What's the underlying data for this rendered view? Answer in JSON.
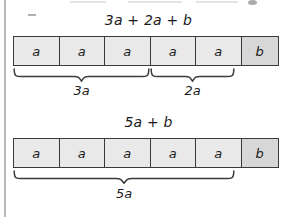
{
  "colors": {
    "cell_fill": "#e9e9e9",
    "cell_b_fill": "#d7d7d7",
    "stroke": "#3a3a3a",
    "text": "#1b1b1b",
    "page_rule": "#b9b9b9"
  },
  "diagrams": [
    {
      "expression": "3a + 2a + b",
      "expression_parts": {
        "t1": "3a",
        "op1": "+",
        "t2": "2a",
        "op2": "+",
        "t3": "b"
      },
      "cells": [
        {
          "label": "a",
          "kind": "a"
        },
        {
          "label": "a",
          "kind": "a"
        },
        {
          "label": "a",
          "kind": "a"
        },
        {
          "label": "a",
          "kind": "a"
        },
        {
          "label": "a",
          "kind": "a"
        },
        {
          "label": "b",
          "kind": "b"
        }
      ],
      "braces": [
        {
          "label": "3a",
          "spans_cells": 3,
          "from_cell": 1,
          "to_cell": 3
        },
        {
          "label": "2a",
          "spans_cells": 2,
          "from_cell": 4,
          "to_cell": 5
        }
      ]
    },
    {
      "expression": "5a + b",
      "expression_parts": {
        "t1": "5a",
        "op1": "+",
        "t2": "b"
      },
      "cells": [
        {
          "label": "a",
          "kind": "a"
        },
        {
          "label": "a",
          "kind": "a"
        },
        {
          "label": "a",
          "kind": "a"
        },
        {
          "label": "a",
          "kind": "a"
        },
        {
          "label": "a",
          "kind": "a"
        },
        {
          "label": "b",
          "kind": "b"
        }
      ],
      "braces": [
        {
          "label": "5a",
          "spans_cells": 5,
          "from_cell": 1,
          "to_cell": 5
        }
      ]
    }
  ]
}
